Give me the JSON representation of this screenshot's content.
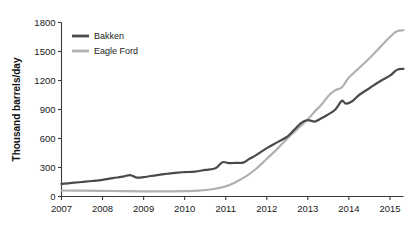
{
  "figure": {
    "cropped_header_text": "",
    "background_color": "#ffffff"
  },
  "chart_data": {
    "type": "line",
    "title": "",
    "subtitle": "",
    "xlabel": "",
    "ylabel": "Thousand barrels/day",
    "xlim": [
      2007.0,
      2015.33
    ],
    "ylim": [
      0,
      1800
    ],
    "yticks": [
      0,
      300,
      600,
      900,
      1200,
      1500,
      1800
    ],
    "ytick_labels": [
      "0",
      "300",
      "600",
      "900",
      "1200",
      "1500",
      "1800"
    ],
    "xticks": [
      2007,
      2008,
      2009,
      2010,
      2011,
      2012,
      2013,
      2014,
      2015
    ],
    "xtick_labels": [
      "2007",
      "2008",
      "2009",
      "2010",
      "2011",
      "2012",
      "2013",
      "2014",
      "2015"
    ],
    "grid": false,
    "legend_position": "top-left-inside",
    "legend_entries": [
      "Bakken",
      "Eagle Ford"
    ],
    "series": [
      {
        "name": "Bakken",
        "color": "#4a4a4a",
        "line_width": 2.2,
        "x": [
          2007.0,
          2007.25,
          2007.5,
          2007.75,
          2008.0,
          2008.25,
          2008.5,
          2008.67,
          2008.83,
          2009.0,
          2009.17,
          2009.33,
          2009.58,
          2009.83,
          2010.0,
          2010.25,
          2010.5,
          2010.75,
          2010.92,
          2011.08,
          2011.25,
          2011.42,
          2011.58,
          2011.75,
          2012.0,
          2012.25,
          2012.5,
          2012.67,
          2012.83,
          2013.0,
          2013.17,
          2013.33,
          2013.5,
          2013.67,
          2013.83,
          2013.92,
          2014.08,
          2014.25,
          2014.5,
          2014.75,
          2015.0,
          2015.17,
          2015.33
        ],
        "y": [
          130,
          140,
          150,
          160,
          172,
          190,
          205,
          222,
          196,
          200,
          212,
          222,
          235,
          248,
          252,
          258,
          275,
          292,
          355,
          345,
          348,
          350,
          390,
          430,
          500,
          560,
          620,
          690,
          760,
          790,
          775,
          810,
          850,
          900,
          990,
          960,
          985,
          1050,
          1120,
          1190,
          1250,
          1310,
          1320
        ]
      },
      {
        "name": "Eagle Ford",
        "color": "#b0b0b0",
        "line_width": 2.2,
        "x": [
          2007.0,
          2007.5,
          2008.0,
          2008.5,
          2009.0,
          2009.5,
          2010.0,
          2010.33,
          2010.67,
          2011.0,
          2011.25,
          2011.5,
          2011.75,
          2012.0,
          2012.25,
          2012.5,
          2012.75,
          2013.0,
          2013.17,
          2013.33,
          2013.5,
          2013.67,
          2013.83,
          2014.0,
          2014.25,
          2014.5,
          2014.75,
          2015.0,
          2015.17,
          2015.33
        ],
        "y": [
          62,
          60,
          58,
          56,
          54,
          52,
          55,
          60,
          75,
          105,
          150,
          210,
          290,
          390,
          490,
          600,
          700,
          800,
          880,
          950,
          1040,
          1100,
          1130,
          1230,
          1330,
          1430,
          1540,
          1650,
          1710,
          1720
        ]
      }
    ],
    "annotations": []
  }
}
